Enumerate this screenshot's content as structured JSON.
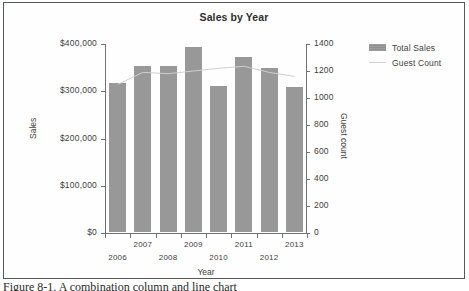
{
  "figure": {
    "caption": "Figure 8-1. A combination column and line chart"
  },
  "legend": {
    "items": [
      {
        "label": "Total Sales",
        "marker": "bar-swatch",
        "color": "#989898"
      },
      {
        "label": "Guest Count",
        "marker": "line-swatch",
        "color": "#cfcfcf"
      }
    ]
  },
  "chart_data": {
    "type": "bar",
    "title": "Sales by Year",
    "xlabel": "Year",
    "ylabel": "Sales",
    "y2label": "Guest count",
    "categories": [
      "2006",
      "2007",
      "2008",
      "2009",
      "2010",
      "2011",
      "2012",
      "2013"
    ],
    "ylim": [
      0,
      400000
    ],
    "y_ticks": [
      0,
      100000,
      200000,
      300000,
      400000
    ],
    "y_ticklabels": [
      "$0",
      "$100,000",
      "$200,000",
      "$300,000",
      "$400,000"
    ],
    "y2lim": [
      0,
      1400
    ],
    "y2_ticks": [
      0,
      200,
      400,
      600,
      800,
      1000,
      1200,
      1400
    ],
    "y2_ticklabels": [
      "0",
      "200",
      "400",
      "600",
      "800",
      "1000",
      "1200",
      "1400"
    ],
    "grid": false,
    "legend_position": "right",
    "series": [
      {
        "name": "Total Sales",
        "type": "bar",
        "axis": "left",
        "color": "#989898",
        "values": [
          315000,
          352000,
          351000,
          391000,
          309000,
          371000,
          347000,
          307000
        ]
      },
      {
        "name": "Guest Count",
        "type": "line",
        "axis": "right",
        "color": "#cfcfcf",
        "values": [
          1100,
          1190,
          1180,
          1200,
          1220,
          1235,
          1190,
          1160
        ]
      }
    ]
  }
}
